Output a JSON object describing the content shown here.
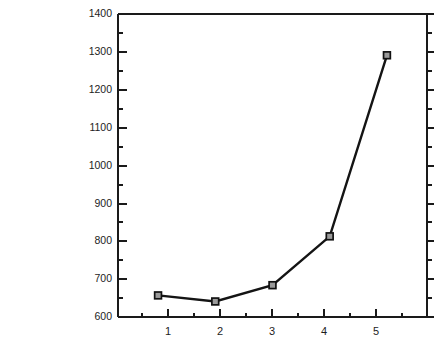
{
  "chart_data": {
    "type": "line",
    "title": "",
    "subtitle": "",
    "xlabel": "",
    "ylabel": "Response Time in msec.",
    "ylabel_lines": [
      "Response",
      "Time in msec."
    ],
    "x": [
      1,
      2,
      3,
      4,
      5
    ],
    "categories": [
      "1",
      "2",
      "3",
      "4",
      "5"
    ],
    "values": [
      657,
      641,
      684,
      813,
      1291
    ],
    "series": [
      {
        "name": "Response Time",
        "values": [
          657,
          641,
          684,
          813,
          1291
        ]
      }
    ],
    "xlim": [
      0.3,
      5.7
    ],
    "ylim": [
      600,
      1400
    ],
    "xticks": [
      1,
      2,
      3,
      4,
      5
    ],
    "xtick_labels": [
      "1",
      "2",
      "3",
      "4",
      "5"
    ],
    "yticks": [
      600,
      700,
      800,
      900,
      1000,
      1100,
      1200,
      1300,
      1400
    ],
    "ytick_labels": [
      "600",
      "700",
      "800",
      "900",
      "1000",
      "1100",
      "1200",
      "1300",
      "1400"
    ],
    "y_minor_ticks": [
      650,
      750,
      850,
      950,
      1050,
      1150,
      1250,
      1350
    ],
    "x_minor_ticks": [
      0.5,
      1.5,
      2.5,
      3.5,
      4.5,
      5.5
    ],
    "grid": false,
    "legend": false,
    "legend_position": "none",
    "marker": "square",
    "line_color": "#141414",
    "marker_face_color": "#9a9a9a",
    "marker_edge_color": "#111111",
    "background_color": "#ffffff",
    "axis_color": "#1a1a1a",
    "annotations": []
  }
}
